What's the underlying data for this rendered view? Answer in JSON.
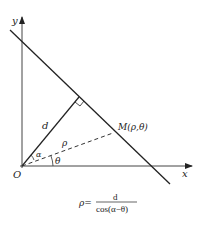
{
  "diagram": {
    "type": "polar-coordinate-line-diagram",
    "axes": {
      "x_label": "x",
      "y_label": "y",
      "origin_label": "O"
    },
    "labels": {
      "perpendicular": "d",
      "radius": "ρ",
      "angle_alpha": "α",
      "angle_theta": "θ",
      "point": "M(ρ,θ)"
    },
    "formula": {
      "lhs": "ρ=",
      "numerator": "d",
      "denominator": "cos(α−θ)"
    },
    "colors": {
      "stroke": "#222222",
      "background": "#ffffff"
    }
  }
}
